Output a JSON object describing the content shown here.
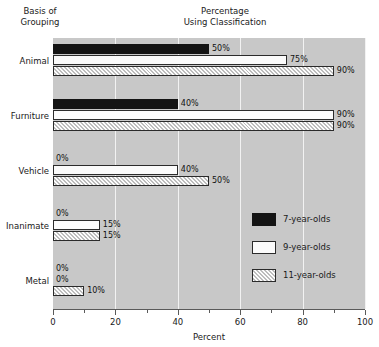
{
  "headers": {
    "y_axis_caption": "Basis of\nGrouping",
    "title": "Percentage\nUsing Classification"
  },
  "axis": {
    "xlabel": "Percent",
    "tick_labels": [
      "0",
      "20",
      "40",
      "60",
      "80",
      "100"
    ]
  },
  "legend": {
    "items": [
      {
        "label": "7-year-olds",
        "swatch": "black-solid"
      },
      {
        "label": "9-year-olds",
        "swatch": "white-solid"
      },
      {
        "label": "11-year-olds",
        "swatch": "gray-hatched"
      }
    ]
  },
  "value_labels": {
    "animal": [
      "50%",
      "75%",
      "90%"
    ],
    "furniture": [
      "40%",
      "90%",
      "90%"
    ],
    "vehicle": [
      "0%",
      "40%",
      "50%"
    ],
    "inanimate": [
      "0%",
      "15%",
      "15%"
    ],
    "metal": [
      "0%",
      "0%",
      "10%"
    ]
  },
  "categories_display": [
    "Animal",
    "Furniture",
    "Vehicle",
    "Inanimate",
    "Metal"
  ],
  "chart_data": {
    "type": "bar",
    "orientation": "horizontal",
    "title": "Percentage Using Classification",
    "xlabel": "Percent",
    "ylabel": "Basis of Grouping",
    "xlim": [
      0,
      100
    ],
    "xticks": [
      0,
      20,
      40,
      60,
      80,
      100
    ],
    "minor_xticks": [
      10,
      30,
      50,
      70,
      90
    ],
    "grid": "vertical-white-gridlines-at-major-ticks",
    "legend_position": "inside-right-lower",
    "categories": [
      "Animal",
      "Furniture",
      "Vehicle",
      "Inanimate",
      "Metal"
    ],
    "series": [
      {
        "name": "7-year-olds",
        "values": [
          50,
          40,
          0,
          0,
          0
        ]
      },
      {
        "name": "9-year-olds",
        "values": [
          75,
          90,
          40,
          15,
          0
        ]
      },
      {
        "name": "11-year-olds",
        "values": [
          90,
          90,
          50,
          15,
          10
        ]
      }
    ],
    "data_labels": [
      [
        "50%",
        "75%",
        "90%"
      ],
      [
        "40%",
        "90%",
        "90%"
      ],
      [
        "0%",
        "40%",
        "50%"
      ],
      [
        "0%",
        "15%",
        "15%"
      ],
      [
        "0%",
        "0%",
        "10%"
      ]
    ]
  },
  "colors": {
    "plot_background": "#c8c8c8",
    "gridline": "#f2f2f2",
    "series_7": "#141414",
    "series_9": "#fbfbfb",
    "series_11": "#d2d2d2",
    "bar_border": "#2b2b2b",
    "text": "#1a1a1a",
    "axis": "#5a5a5a"
  }
}
